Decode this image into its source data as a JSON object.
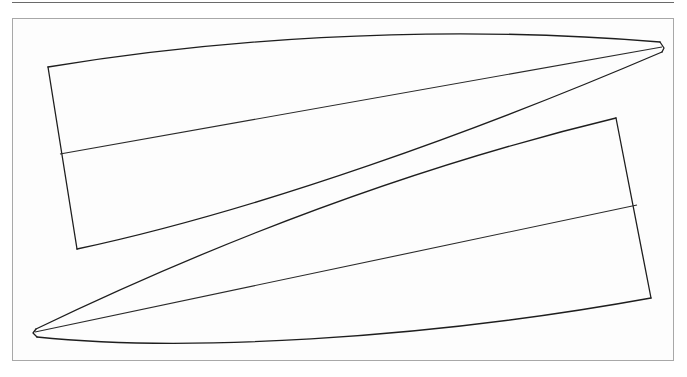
{
  "diagram": {
    "type": "hull-panel-pattern",
    "stroke_color": "#1e1e1e",
    "frame_color": "#a8a8a8",
    "panels": [
      {
        "name": "upper-panel",
        "points": {
          "top_left": [
            48,
            67
          ],
          "bottom_left": [
            77,
            249
          ],
          "tip": [
            662,
            45
          ]
        },
        "centerline": [
          [
            60,
            154
          ],
          [
            662,
            47
          ]
        ]
      },
      {
        "name": "lower-panel",
        "points": {
          "top_right": [
            616,
            118
          ],
          "bottom_right": [
            651,
            298
          ],
          "tip": [
            35,
            332
          ]
        },
        "centerline": [
          [
            35,
            332
          ],
          [
            637,
            205
          ]
        ]
      }
    ]
  }
}
